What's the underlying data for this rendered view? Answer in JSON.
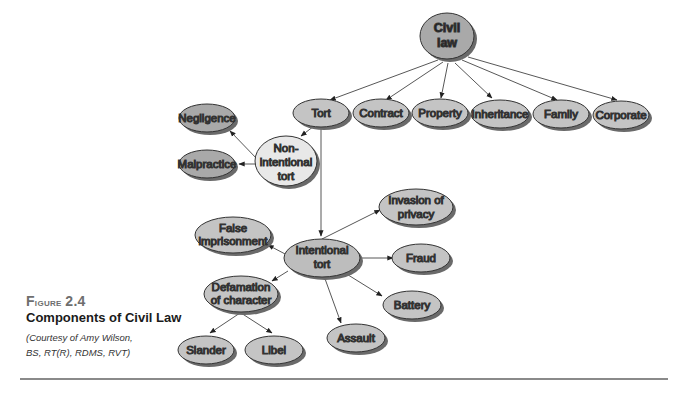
{
  "figure": {
    "number_label": "Figure 2.4",
    "number_prefix": "F",
    "number_rest": "igure",
    "number_value": "2.4",
    "title": "Components of Civil Law",
    "credit_line1": "(Courtesy of Amy Wilson,",
    "credit_line2": "BS, RT(R), RDMS, RVT)"
  },
  "colors": {
    "dark_node": "#a9a9a9",
    "mid_node": "#c4c4c4",
    "light_node": "#e8e8e8",
    "shadow": "#6a6a6a",
    "stroke": "#333333",
    "edge": "#444444"
  },
  "nodes": {
    "civil_law": {
      "line1": "Civil",
      "line2": "law"
    },
    "tort": {
      "label": "Tort"
    },
    "contract": {
      "label": "Contract"
    },
    "property": {
      "label": "Property"
    },
    "inheritance": {
      "label": "Inheritance"
    },
    "family": {
      "label": "Family"
    },
    "corporate": {
      "label": "Corporate"
    },
    "negligence": {
      "label": "Negligence"
    },
    "malpractice": {
      "label": "Malpractice"
    },
    "non_intentional_tort": {
      "line1": "Non-",
      "line2": "intentional",
      "line3": "tort"
    },
    "intentional_tort": {
      "line1": "Intentional",
      "line2": "tort"
    },
    "false_imprisonment": {
      "line1": "False",
      "line2": "imprisonment"
    },
    "invasion_of_privacy": {
      "line1": "Invasion of",
      "line2": "privacy"
    },
    "fraud": {
      "label": "Fraud"
    },
    "battery": {
      "label": "Battery"
    },
    "assault": {
      "label": "Assault"
    },
    "defamation_of_character": {
      "line1": "Defamation",
      "line2": "of character"
    },
    "slander": {
      "label": "Slander"
    },
    "libel": {
      "label": "Libel"
    }
  }
}
